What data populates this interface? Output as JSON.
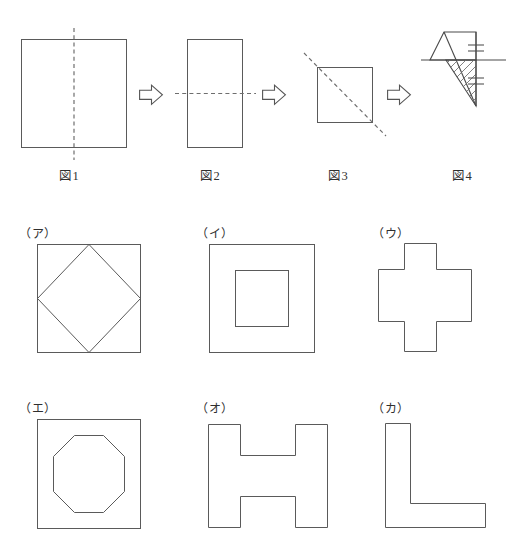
{
  "page": {
    "width": 516,
    "height": 548,
    "background": "#ffffff",
    "line_color": "#5a5a5a",
    "dashed_color": "#6e6e6e"
  },
  "sequence": {
    "steps": [
      {
        "label": "図1",
        "caption_id": "fig-1",
        "shape": "square",
        "fold_line": "vertical-dashed-center",
        "x": 21,
        "y": 39,
        "w": 105,
        "h": 108
      },
      {
        "label": "図2",
        "caption_id": "fig-2",
        "shape": "tall-rectangle",
        "fold_line": "horizontal-dashed-center",
        "x": 187,
        "y": 39,
        "w": 55,
        "h": 108
      },
      {
        "label": "図3",
        "caption_id": "fig-3",
        "shape": "square",
        "fold_line": "diagonal-dashed",
        "x": 317,
        "y": 67,
        "w": 55,
        "h": 55
      },
      {
        "label": "図4",
        "caption_id": "fig-4",
        "shape": "folded-triangle-with-cut",
        "fold_line": "none",
        "hatched": true,
        "x": 440,
        "y": 60,
        "w": 50,
        "h": 60
      }
    ],
    "arrows": [
      {
        "name": "arrow-1",
        "x": 139,
        "y": 85
      },
      {
        "name": "arrow-2",
        "x": 262,
        "y": 85
      },
      {
        "name": "arrow-3",
        "x": 387,
        "y": 85
      }
    ],
    "arrow_glyph": "right-arrow-outline"
  },
  "options": [
    {
      "label": "（ア）",
      "id": "option-a",
      "description": "square-with-inscribed-diamond",
      "label_x": 19,
      "label_y": 226,
      "box_x": 37,
      "box_y": 244,
      "box_w": 103,
      "box_h": 108
    },
    {
      "label": "（イ）",
      "id": "option-b",
      "description": "square-with-inner-square",
      "label_x": 196,
      "label_y": 226,
      "box_x": 209,
      "box_y": 244,
      "box_w": 105,
      "box_h": 108,
      "inner_inset": 26
    },
    {
      "label": "（ウ）",
      "id": "option-c",
      "description": "plus-cross",
      "label_x": 372,
      "label_y": 226,
      "box_x": 378,
      "box_y": 243,
      "box_w": 107,
      "box_h": 109
    },
    {
      "label": "（エ）",
      "id": "option-d",
      "description": "square-with-inner-octagon",
      "label_x": 19,
      "label_y": 401,
      "box_x": 37,
      "box_y": 419,
      "box_w": 103,
      "box_h": 109
    },
    {
      "label": "（オ）",
      "id": "option-e",
      "description": "h-shape",
      "label_x": 196,
      "label_y": 401,
      "box_x": 208,
      "box_y": 424,
      "box_w": 120,
      "box_h": 104
    },
    {
      "label": "（カ）",
      "id": "option-f",
      "description": "l-shape",
      "label_x": 372,
      "label_y": 401,
      "box_x": 385,
      "box_y": 423,
      "box_w": 100,
      "box_h": 105
    }
  ]
}
